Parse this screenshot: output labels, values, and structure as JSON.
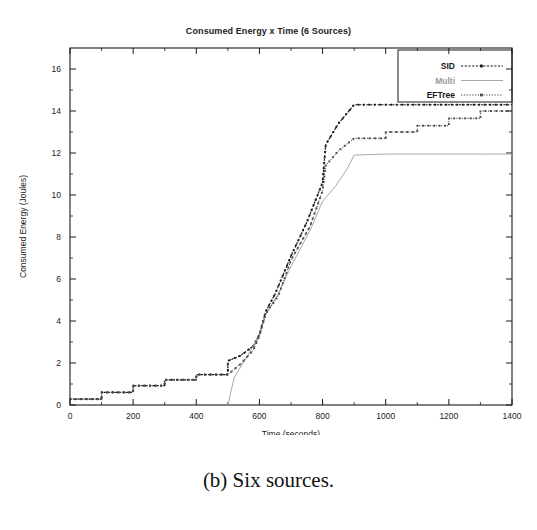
{
  "figure": {
    "caption": "(b) Six sources."
  },
  "chart_data": {
    "type": "line",
    "title": "Consumed Energy x Time (6 Sources)",
    "xlabel": "Time (seconds)",
    "ylabel": "Consumed Energy (Joules)",
    "xlim": [
      0,
      1400
    ],
    "ylim": [
      0,
      17
    ],
    "xticks": [
      0,
      200,
      400,
      600,
      800,
      1000,
      1200,
      1400
    ],
    "xtick_labels": [
      "0",
      "200",
      "400",
      "600",
      "800",
      "1000",
      "1200",
      "1400"
    ],
    "yticks": [
      0,
      2,
      4,
      6,
      8,
      10,
      12,
      14,
      16
    ],
    "ytick_labels": [
      "0",
      "2",
      "4",
      "6",
      "8",
      "10",
      "12",
      "14",
      "16"
    ],
    "grid": false,
    "legend_position": "top-right",
    "legend": [
      "SID",
      "Multi",
      "EFTree"
    ],
    "series": [
      {
        "name": "SID",
        "color": "#141414",
        "style": "dashed-with-points",
        "points": [
          [
            0,
            0.28
          ],
          [
            100,
            0.28
          ],
          [
            100,
            0.6
          ],
          [
            200,
            0.6
          ],
          [
            200,
            0.92
          ],
          [
            300,
            0.92
          ],
          [
            300,
            1.2
          ],
          [
            400,
            1.2
          ],
          [
            400,
            1.45
          ],
          [
            500,
            1.45
          ],
          [
            500,
            2.1
          ],
          [
            540,
            2.35
          ],
          [
            580,
            2.8
          ],
          [
            600,
            3.35
          ],
          [
            620,
            4.45
          ],
          [
            650,
            5.3
          ],
          [
            700,
            7.1
          ],
          [
            750,
            8.7
          ],
          [
            800,
            10.6
          ],
          [
            810,
            12.4
          ],
          [
            850,
            13.4
          ],
          [
            900,
            14.3
          ],
          [
            1000,
            14.3
          ],
          [
            1100,
            14.3
          ],
          [
            1200,
            14.3
          ],
          [
            1300,
            14.3
          ],
          [
            1400,
            14.3
          ]
        ]
      },
      {
        "name": "Multi",
        "color": "#a8a8a8",
        "style": "solid-thin",
        "points": [
          [
            500,
            0.0
          ],
          [
            520,
            1.3
          ],
          [
            560,
            2.3
          ],
          [
            600,
            3.3
          ],
          [
            620,
            4.3
          ],
          [
            660,
            5.3
          ],
          [
            700,
            6.6
          ],
          [
            760,
            8.3
          ],
          [
            800,
            9.7
          ],
          [
            840,
            10.4
          ],
          [
            880,
            11.3
          ],
          [
            900,
            11.9
          ],
          [
            1000,
            11.95
          ],
          [
            1100,
            11.95
          ],
          [
            1200,
            11.95
          ],
          [
            1300,
            11.95
          ],
          [
            1400,
            11.95
          ]
        ]
      },
      {
        "name": "EFTree",
        "color": "#4a4a4a",
        "style": "dotted-with-points",
        "points": [
          [
            0,
            0.28
          ],
          [
            100,
            0.28
          ],
          [
            100,
            0.6
          ],
          [
            200,
            0.6
          ],
          [
            200,
            0.92
          ],
          [
            300,
            0.92
          ],
          [
            300,
            1.2
          ],
          [
            400,
            1.2
          ],
          [
            400,
            1.45
          ],
          [
            500,
            1.45
          ],
          [
            540,
            1.95
          ],
          [
            580,
            2.6
          ],
          [
            600,
            3.3
          ],
          [
            620,
            4.35
          ],
          [
            660,
            5.2
          ],
          [
            700,
            6.9
          ],
          [
            760,
            8.5
          ],
          [
            800,
            10.2
          ],
          [
            810,
            11.4
          ],
          [
            850,
            12.1
          ],
          [
            900,
            12.7
          ],
          [
            1000,
            12.7
          ],
          [
            1000,
            13.0
          ],
          [
            1100,
            13.0
          ],
          [
            1100,
            13.3
          ],
          [
            1200,
            13.3
          ],
          [
            1200,
            13.65
          ],
          [
            1300,
            13.65
          ],
          [
            1300,
            14.0
          ],
          [
            1400,
            14.0
          ]
        ]
      }
    ]
  }
}
